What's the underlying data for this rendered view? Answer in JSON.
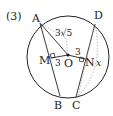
{
  "problem_number": "(3)",
  "points": {
    "A": "A",
    "B": "B",
    "C": "C",
    "D": "D",
    "M": "M",
    "O": "O",
    "N": "N"
  },
  "labels": {
    "AO_length": "3√5",
    "MO_length": "3",
    "ON_length": "3",
    "unknown": "x"
  },
  "colors": {
    "line": "#222222",
    "dashed": "#888888"
  }
}
